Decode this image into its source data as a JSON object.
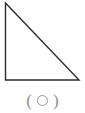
{
  "figure": {
    "name": "right-triangle-figure",
    "canvas": {
      "width": 85,
      "height": 113,
      "background_color": "#ffffff"
    },
    "shape": {
      "type": "right-triangle",
      "stroke_color": "#2b2b2b",
      "fill_color": "none",
      "stroke_width": 1.4,
      "vertices": [
        {
          "label": "apex-top-left",
          "x": 5.5,
          "y": 3
        },
        {
          "label": "right-angle-bottom-left",
          "x": 5.5,
          "y": 80
        },
        {
          "label": "base-right",
          "x": 79,
          "y": 80
        }
      ],
      "edges": [
        {
          "name": "left-leg-vertical",
          "from": "apex-top-left",
          "to": "right-angle-bottom-left"
        },
        {
          "name": "bottom-leg-horizontal",
          "from": "right-angle-bottom-left",
          "to": "base-right"
        },
        {
          "name": "hypotenuse",
          "from": "apex-top-left",
          "to": "base-right"
        }
      ]
    },
    "caption": {
      "text": "( ○ )",
      "left_paren": "(",
      "right_paren": ")",
      "bubble_icon": "circle-outline-icon",
      "bubble_value": "",
      "color": "#8e8e8e",
      "bubble_stroke_color": "#9a9a9a"
    }
  }
}
